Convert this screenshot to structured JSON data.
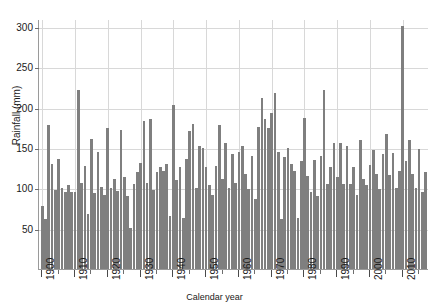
{
  "axes": {
    "ylabel": "Rainfall (mm)",
    "xlabel": "Calendar year",
    "yticks": [
      "50",
      "100",
      "150",
      "200",
      "250",
      "300"
    ],
    "ytick_values": [
      50,
      100,
      150,
      200,
      250,
      300
    ],
    "xticks": [
      "1900",
      "1910",
      "1920",
      "1930",
      "1940",
      "1950",
      "1960",
      "1970",
      "1980",
      "1990",
      "2000",
      "2010"
    ],
    "xtick_values": [
      1900,
      1910,
      1920,
      1930,
      1940,
      1950,
      1960,
      1970,
      1980,
      1990,
      2000,
      2010
    ]
  },
  "colors": {
    "bar": "#7f7f7f",
    "grid": "#d8d8d8",
    "axis": "#9a9a9a",
    "text": "#1a1a1a",
    "background": "#ffffff"
  },
  "chart_data": {
    "type": "bar",
    "title": "",
    "xlabel": "Calendar year",
    "ylabel": "Rainfall (mm)",
    "xlim": [
      1899,
      2018
    ],
    "ylim": [
      0,
      310
    ],
    "grid": true,
    "legend": "none",
    "x": [
      1900,
      1901,
      1902,
      1903,
      1904,
      1905,
      1906,
      1907,
      1908,
      1909,
      1910,
      1911,
      1912,
      1913,
      1914,
      1915,
      1916,
      1917,
      1918,
      1919,
      1920,
      1921,
      1922,
      1923,
      1924,
      1925,
      1926,
      1927,
      1928,
      1929,
      1930,
      1931,
      1932,
      1933,
      1934,
      1935,
      1936,
      1937,
      1938,
      1939,
      1940,
      1941,
      1942,
      1943,
      1944,
      1945,
      1946,
      1947,
      1948,
      1949,
      1950,
      1951,
      1952,
      1953,
      1954,
      1955,
      1956,
      1957,
      1958,
      1959,
      1960,
      1961,
      1962,
      1963,
      1964,
      1965,
      1966,
      1967,
      1968,
      1969,
      1970,
      1971,
      1972,
      1973,
      1974,
      1975,
      1976,
      1977,
      1978,
      1979,
      1980,
      1981,
      1982,
      1983,
      1984,
      1985,
      1986,
      1987,
      1988,
      1989,
      1990,
      1991,
      1992,
      1993,
      1994,
      1995,
      1996,
      1997,
      1998,
      1999,
      2000,
      2001,
      2002,
      2003,
      2004,
      2005,
      2006,
      2007,
      2008,
      2009,
      2010,
      2011,
      2012,
      2013,
      2014,
      2015,
      2016,
      2017
    ],
    "values": [
      78,
      62,
      178,
      130,
      98,
      137,
      100,
      96,
      104,
      95,
      96,
      222,
      107,
      128,
      68,
      161,
      94,
      145,
      102,
      92,
      175,
      100,
      112,
      97,
      172,
      114,
      90,
      51,
      106,
      120,
      132,
      184,
      107,
      186,
      98,
      120,
      126,
      122,
      130,
      66,
      203,
      110,
      127,
      63,
      137,
      171,
      180,
      100,
      152,
      150,
      126,
      104,
      92,
      128,
      178,
      112,
      156,
      101,
      142,
      107,
      145,
      153,
      118,
      99,
      140,
      87,
      176,
      212,
      186,
      175,
      193,
      218,
      145,
      62,
      139,
      150,
      130,
      122,
      63,
      134,
      187,
      115,
      95,
      135,
      91,
      140,
      222,
      105,
      127,
      156,
      114,
      156,
      106,
      152,
      105,
      126,
      92,
      160,
      112,
      104,
      129,
      147,
      118,
      99,
      142,
      168,
      117,
      144,
      100,
      122,
      301,
      134,
      160,
      118,
      101,
      149,
      96,
      120
    ]
  }
}
